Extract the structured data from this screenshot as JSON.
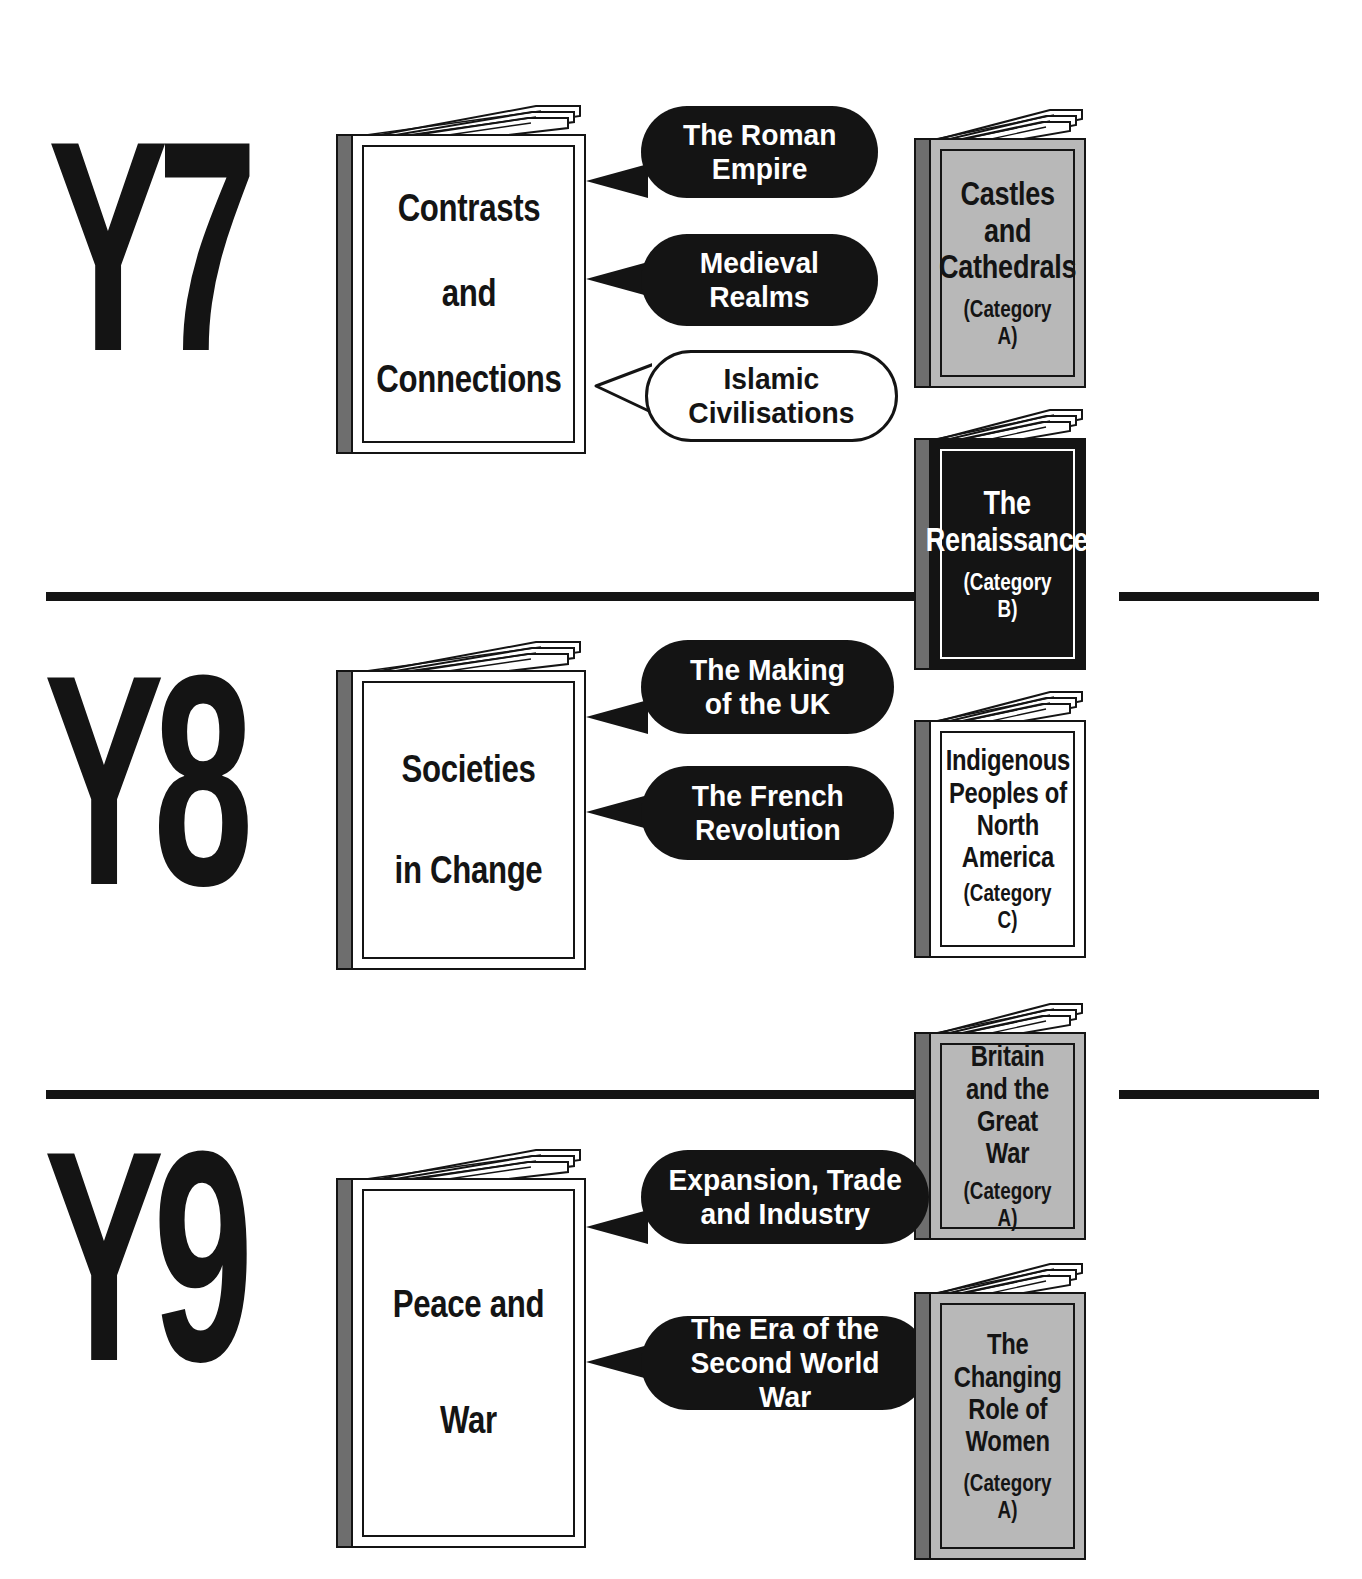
{
  "document": {
    "title_cropped": "",
    "layout": "three-row year plan with books and speech bubbles"
  },
  "colors": {
    "ink": "#141414",
    "book_gray": "#b8b8b8",
    "spine_gray": "#6e6e6e",
    "paper": "#ffffff"
  },
  "rows": [
    {
      "year": "Y7",
      "core_book": {
        "title": "Contrasts\nand\nConnections",
        "cover": "white",
        "category": ""
      },
      "bubbles": [
        {
          "text": "The Roman\nEmpire",
          "style": "dark"
        },
        {
          "text": "Medieval\nRealms",
          "style": "dark"
        },
        {
          "text": "Islamic\nCivilisations",
          "style": "light"
        }
      ],
      "books": [
        {
          "title": "Castles\nand\nCathedrals",
          "category": "(Category A)",
          "cover": "gray"
        }
      ]
    },
    {
      "year": "Y8",
      "core_book": {
        "title": "Societies\nin\nChange",
        "cover": "white",
        "category": ""
      },
      "bubbles": [
        {
          "text": "The Making\nof the UK",
          "style": "dark"
        },
        {
          "text": "The French\nRevolution",
          "style": "dark"
        }
      ],
      "books": [
        {
          "title": "The\nRenaissance",
          "category": "(Category B)",
          "cover": "black"
        },
        {
          "title": "Indigenous\nPeoples of\nNorth\nAmerica",
          "category": "(Category C)",
          "cover": "white"
        }
      ]
    },
    {
      "year": "Y9",
      "core_book": {
        "title": "Peace\nand\nWar",
        "cover": "white",
        "category": ""
      },
      "bubbles": [
        {
          "text": "Expansion, Trade\nand Industry",
          "style": "dark"
        },
        {
          "text": "The Era of the\nSecond World War",
          "style": "dark"
        }
      ],
      "books": [
        {
          "title": "Britain\nand the\nGreat\nWar",
          "category": "(Category A)",
          "cover": "gray"
        },
        {
          "title": "The\nChanging\nRole of\nWomen",
          "category": "(Category A)",
          "cover": "gray"
        }
      ]
    }
  ],
  "year_labels": {
    "y7": "Y7",
    "y8": "Y8",
    "y9": "Y9"
  }
}
